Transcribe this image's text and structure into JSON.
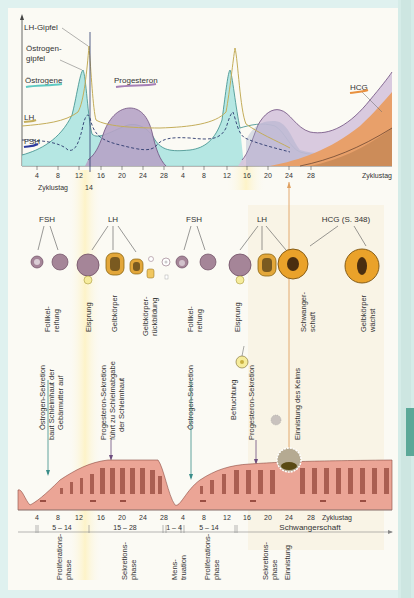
{
  "hormone_chart": {
    "labels": {
      "lh_peak": "LH-Gipfel",
      "estrogen_peak_line1": "Östrogen-",
      "estrogen_peak_line2": "gipfel",
      "estrogens": "Östrogene",
      "progesterone": "Progesteron",
      "lh": "LH",
      "fsh": "FSH",
      "hcg": "HCG",
      "cycle_day": "Zyklustag",
      "cycle_day_marker": "14",
      "cycle_day_right": "Zyklustag"
    },
    "x_ticks": [
      "4",
      "8",
      "12",
      "16",
      "20",
      "24",
      "28",
      "4",
      "8",
      "12",
      "16",
      "20",
      "24",
      "28"
    ],
    "colors": {
      "estrogen": "#9fdedb",
      "progesterone": "#cdb8d6",
      "lh": "#c9b46a",
      "fsh": "#2d3a6e",
      "hcg": "#e39a5e",
      "hcg_dark": "#c98050"
    }
  },
  "ovary_row": {
    "hormone_labels": [
      "FSH",
      "LH",
      "FSH",
      "LH",
      "HCG (S. 348)"
    ],
    "stage_labels": [
      {
        "line1": "Follikel-",
        "line2": "reifung"
      },
      {
        "line1": "Eisprung",
        "line2": ""
      },
      {
        "line1": "Gelbkörper",
        "line2": ""
      },
      {
        "line1": "Gelbkörper-",
        "line2": "rückbildung"
      },
      {
        "line1": "Follikel-",
        "line2": "reifung"
      },
      {
        "line1": "Eisprung",
        "line2": ""
      },
      {
        "line1": "Schwanger-",
        "line2": "schaft"
      },
      {
        "line1": "Gelbkörper",
        "line2": "wächst"
      }
    ]
  },
  "uterus_row": {
    "annotations": [
      {
        "line1": "Östrogen-Sekretion",
        "line2": "baut Schleimhaut der",
        "line3": "Gebärmutter auf"
      },
      {
        "line1": "Progesteron-Sekretion",
        "line2": "führt zu Schleimabgabe",
        "line3": "der Schleimhaut"
      },
      {
        "line1": "Östrogen-Sekretion"
      },
      {
        "line1": "Befruchtung"
      },
      {
        "line1": "Progesteron-Sekretion"
      },
      {
        "line1": "Einnistung des Keims"
      }
    ],
    "x_ticks": [
      "4",
      "8",
      "12",
      "16",
      "20",
      "24",
      "28",
      "4",
      "8",
      "12",
      "16",
      "20",
      "24",
      "28"
    ],
    "axis_label": "Zyklustag"
  },
  "phases": {
    "ranges": [
      "5 – 14",
      "15 – 28",
      "1 – 4",
      "5 – 14"
    ],
    "pregnancy": "Schwangerschaft",
    "labels": [
      {
        "line1": "Proliferations-",
        "line2": "phase"
      },
      {
        "line1": "Sekretions-",
        "line2": "phase"
      },
      {
        "line1": "Mens-",
        "line2": "truation"
      },
      {
        "line1": "Proliferations-",
        "line2": "phase"
      },
      {
        "line1": "Sekretions-",
        "line2": "phase"
      },
      {
        "line1": "Einnistung",
        "line2": ""
      }
    ]
  }
}
